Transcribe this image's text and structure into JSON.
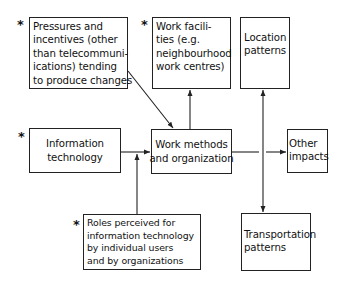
{
  "diagram": {
    "marker_symbol": "*",
    "boxes": {
      "pressures": {
        "lines": [
          "Pressures and",
          "incentives (other",
          "than telecommuni-",
          "ications) tending",
          "to produce changes"
        ],
        "starred": true
      },
      "work_facilities": {
        "lines": [
          "Work facili-",
          "ties (e.g.",
          "neighbourhood",
          "work centres)"
        ],
        "starred": true
      },
      "location_patterns": {
        "lines": [
          "Location",
          "patterns"
        ],
        "starred": false
      },
      "information_technology": {
        "lines": [
          "Information",
          "technology"
        ],
        "starred": true
      },
      "work_methods": {
        "lines": [
          "Work methods",
          "and organization"
        ],
        "starred": false
      },
      "other_impacts": {
        "lines": [
          "Other",
          "impacts"
        ],
        "starred": false
      },
      "roles_perceived": {
        "lines": [
          "Roles perceived for",
          "information technology",
          "by individual users",
          "and by organizations"
        ],
        "starred": true
      },
      "transportation_patterns": {
        "lines": [
          "Transportation",
          "patterns"
        ],
        "starred": false
      }
    },
    "edges": [
      {
        "from": "pressures",
        "to": "work_methods"
      },
      {
        "from": "information_technology",
        "to": "work_methods"
      },
      {
        "from": "roles_perceived",
        "to": "work_methods"
      },
      {
        "from": "work_methods",
        "to": "work_facilities"
      },
      {
        "from": "work_methods",
        "to": "other_impacts"
      },
      {
        "from": "work_methods",
        "to": "location_patterns"
      },
      {
        "from": "work_methods",
        "to": "transportation_patterns"
      }
    ]
  }
}
